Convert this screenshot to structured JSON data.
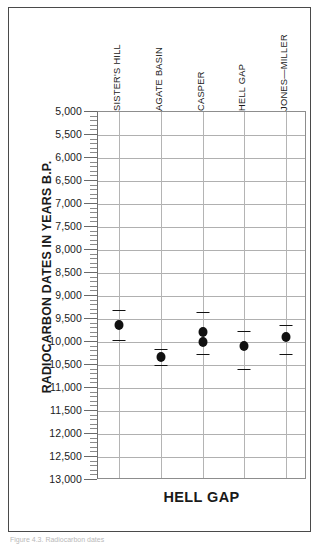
{
  "figure": {
    "caption": "Figure 4.3. Radiocarbon dates"
  },
  "chart_data": {
    "type": "scatter",
    "title": "",
    "xlabel": "HELL GAP",
    "ylabel": "RADIOCARBON DATES IN YEARS B.P.",
    "y_inverted": true,
    "ylim": [
      5000,
      13000
    ],
    "ytick_step": 500,
    "yminor_step": 100,
    "grid": "both",
    "legend": "none",
    "ytick_labels": [
      "5,000",
      "5,500",
      "6,000",
      "6,500",
      "7,000",
      "7,500",
      "8,000",
      "8,500",
      "9,000",
      "9,500",
      "10,000",
      "10,500",
      "11,000",
      "11,500",
      "12,000",
      "12,500",
      "13,000"
    ],
    "ytick_values": [
      5000,
      5500,
      6000,
      6500,
      7000,
      7500,
      8000,
      8500,
      9000,
      9500,
      10000,
      10500,
      11000,
      11500,
      12000,
      12500,
      13000
    ],
    "categories": [
      "SISTER'S HILL",
      "AGATE BASIN",
      "CASPER",
      "HELL GAP",
      "JONES—MILLER"
    ],
    "points": [
      {
        "category": "SISTER'S HILL",
        "index": 0,
        "value": 9620,
        "low": 9300,
        "high": 9950
      },
      {
        "category": "AGATE BASIN",
        "index": 1,
        "value": 10320,
        "low": 10150,
        "high": 10500
      },
      {
        "category": "CASPER",
        "index": 2,
        "value": 9790,
        "low": 9350,
        "high": 10260
      },
      {
        "category": "CASPER",
        "index": 2,
        "value": 10010,
        "low": 9350,
        "high": 10260
      },
      {
        "category": "HELL GAP",
        "index": 3,
        "value": 10080,
        "low": 9760,
        "high": 10580
      },
      {
        "category": "JONES—MILLER",
        "index": 4,
        "value": 9900,
        "low": 9640,
        "high": 10250
      }
    ]
  }
}
